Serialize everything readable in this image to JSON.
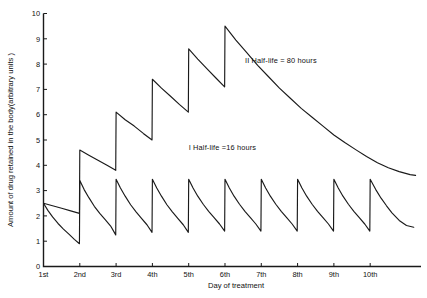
{
  "chart_data": {
    "type": "line",
    "title": "",
    "xlabel": "Day of treatment",
    "ylabel": "Amount of drug retained in the body(arbitrary units )",
    "xlim": [
      1,
      11.4
    ],
    "ylim": [
      0,
      10
    ],
    "grid": false,
    "legend_position": "inline-annotation",
    "x_tick_labels": [
      "1st",
      "2nd",
      "3rd",
      "4th",
      "5th",
      "6th",
      "7th",
      "8th",
      "9th",
      "10th"
    ],
    "x_tick_values": [
      1,
      2,
      3,
      4,
      5,
      6,
      7,
      8,
      9,
      10
    ],
    "y_tick_labels": [
      "0",
      "1",
      "2",
      "3",
      "4",
      "5",
      "6",
      "7",
      "8",
      "9",
      "10"
    ],
    "y_tick_values": [
      0,
      1,
      2,
      3,
      4,
      5,
      6,
      7,
      8,
      9,
      10
    ],
    "annotations": [
      {
        "id": "curve-2-label",
        "text": "II  Half-life = 80 hours",
        "x": 6.55,
        "y": 8.05
      },
      {
        "id": "curve-1-label",
        "text": "I  Half-life =16 hours",
        "x": 5.0,
        "y": 4.62
      }
    ],
    "series": [
      {
        "name": "I  Half-life =16 hours",
        "half_life_hours": 16,
        "doses_days": [
          1,
          2,
          3,
          4,
          5,
          6,
          7,
          8,
          9,
          10
        ],
        "dose_peaks": [
          2.5,
          3.4,
          3.45,
          3.45,
          3.45,
          3.45,
          3.45,
          3.45,
          3.45,
          3.45
        ],
        "pre_dose_troughs": [
          0.9,
          1.25,
          1.35,
          1.35,
          1.4,
          1.4,
          1.4,
          1.4,
          1.4
        ],
        "end_value": 1.55,
        "points": [
          [
            1.0,
            2.5
          ],
          [
            1.12,
            2.22
          ],
          [
            1.25,
            1.96
          ],
          [
            1.4,
            1.7
          ],
          [
            1.55,
            1.48
          ],
          [
            1.7,
            1.28
          ],
          [
            1.85,
            1.07
          ],
          [
            1.99,
            0.9
          ],
          [
            2.0,
            3.4
          ],
          [
            2.12,
            3.04
          ],
          [
            2.25,
            2.72
          ],
          [
            2.4,
            2.38
          ],
          [
            2.55,
            2.1
          ],
          [
            2.7,
            1.85
          ],
          [
            2.85,
            1.6
          ],
          [
            2.99,
            1.25
          ],
          [
            3.0,
            3.45
          ],
          [
            3.12,
            3.1
          ],
          [
            3.25,
            2.78
          ],
          [
            3.4,
            2.44
          ],
          [
            3.55,
            2.16
          ],
          [
            3.7,
            1.9
          ],
          [
            3.85,
            1.65
          ],
          [
            3.99,
            1.35
          ],
          [
            4.0,
            3.45
          ],
          [
            4.12,
            3.1
          ],
          [
            4.25,
            2.78
          ],
          [
            4.4,
            2.44
          ],
          [
            4.55,
            2.16
          ],
          [
            4.7,
            1.9
          ],
          [
            4.85,
            1.65
          ],
          [
            4.99,
            1.35
          ],
          [
            5.0,
            3.45
          ],
          [
            5.12,
            3.1
          ],
          [
            5.25,
            2.78
          ],
          [
            5.4,
            2.46
          ],
          [
            5.55,
            2.18
          ],
          [
            5.7,
            1.93
          ],
          [
            5.85,
            1.68
          ],
          [
            5.99,
            1.4
          ],
          [
            6.0,
            3.45
          ],
          [
            6.12,
            3.1
          ],
          [
            6.25,
            2.78
          ],
          [
            6.4,
            2.46
          ],
          [
            6.55,
            2.18
          ],
          [
            6.7,
            1.93
          ],
          [
            6.85,
            1.68
          ],
          [
            6.99,
            1.4
          ],
          [
            7.0,
            3.45
          ],
          [
            7.12,
            3.1
          ],
          [
            7.25,
            2.78
          ],
          [
            7.4,
            2.46
          ],
          [
            7.55,
            2.18
          ],
          [
            7.7,
            1.93
          ],
          [
            7.85,
            1.68
          ],
          [
            7.99,
            1.4
          ],
          [
            8.0,
            3.45
          ],
          [
            8.12,
            3.1
          ],
          [
            8.25,
            2.78
          ],
          [
            8.4,
            2.46
          ],
          [
            8.55,
            2.18
          ],
          [
            8.7,
            1.93
          ],
          [
            8.85,
            1.68
          ],
          [
            8.99,
            1.4
          ],
          [
            9.0,
            3.45
          ],
          [
            9.12,
            3.1
          ],
          [
            9.25,
            2.78
          ],
          [
            9.4,
            2.46
          ],
          [
            9.55,
            2.18
          ],
          [
            9.7,
            1.93
          ],
          [
            9.85,
            1.68
          ],
          [
            9.99,
            1.4
          ],
          [
            10.0,
            3.45
          ],
          [
            10.15,
            3.05
          ],
          [
            10.3,
            2.7
          ],
          [
            10.45,
            2.4
          ],
          [
            10.6,
            2.12
          ],
          [
            10.8,
            1.82
          ],
          [
            11.0,
            1.62
          ],
          [
            11.2,
            1.55
          ]
        ]
      },
      {
        "name": "II  Half-life = 80 hours",
        "half_life_hours": 80,
        "doses_days": [
          1,
          2,
          3,
          4,
          5,
          6
        ],
        "dose_peaks": [
          2.5,
          4.6,
          6.1,
          7.4,
          8.6,
          9.5
        ],
        "pre_dose_troughs": [
          2.1,
          3.8,
          5.0,
          6.1,
          7.1
        ],
        "end_value": 3.6,
        "points": [
          [
            1.0,
            2.5
          ],
          [
            1.25,
            2.4
          ],
          [
            1.5,
            2.3
          ],
          [
            1.75,
            2.2
          ],
          [
            1.99,
            2.1
          ],
          [
            2.0,
            4.6
          ],
          [
            2.25,
            4.4
          ],
          [
            2.5,
            4.2
          ],
          [
            2.75,
            4.0
          ],
          [
            2.99,
            3.8
          ],
          [
            3.0,
            6.1
          ],
          [
            3.25,
            5.8
          ],
          [
            3.5,
            5.55
          ],
          [
            3.75,
            5.26
          ],
          [
            3.99,
            5.0
          ],
          [
            4.0,
            7.4
          ],
          [
            4.25,
            7.05
          ],
          [
            4.5,
            6.73
          ],
          [
            4.75,
            6.4
          ],
          [
            4.99,
            6.1
          ],
          [
            5.0,
            8.6
          ],
          [
            5.25,
            8.2
          ],
          [
            5.5,
            7.82
          ],
          [
            5.75,
            7.45
          ],
          [
            5.99,
            7.1
          ],
          [
            6.0,
            9.5
          ],
          [
            6.3,
            8.95
          ],
          [
            6.6,
            8.45
          ],
          [
            6.9,
            7.95
          ],
          [
            7.2,
            7.5
          ],
          [
            7.5,
            7.05
          ],
          [
            7.8,
            6.65
          ],
          [
            8.1,
            6.25
          ],
          [
            8.4,
            5.9
          ],
          [
            8.7,
            5.55
          ],
          [
            9.0,
            5.2
          ],
          [
            9.3,
            4.9
          ],
          [
            9.6,
            4.62
          ],
          [
            9.9,
            4.35
          ],
          [
            10.2,
            4.1
          ],
          [
            10.5,
            3.9
          ],
          [
            10.8,
            3.75
          ],
          [
            11.1,
            3.63
          ],
          [
            11.25,
            3.6
          ]
        ]
      }
    ]
  }
}
